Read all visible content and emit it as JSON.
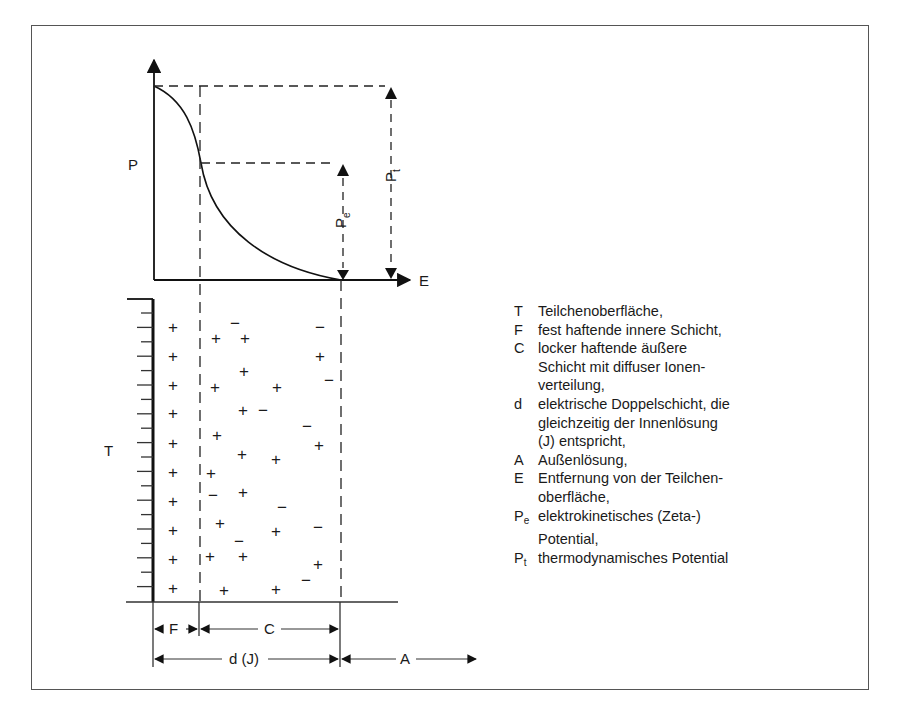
{
  "diagram": {
    "axis": {
      "y_label": "P",
      "x_label": "E"
    },
    "potential_labels": {
      "pe": "P",
      "pe_sub": "e",
      "pt": "P",
      "pt_sub": "t"
    },
    "wall_label": "T",
    "dimensions": {
      "F": "F",
      "C": "C",
      "d": "d (J)",
      "A": "A"
    },
    "charges": {
      "fixed_layer_plus_y": [
        327,
        356,
        385,
        413,
        443,
        472,
        501,
        530,
        559,
        588
      ],
      "diffuse": [
        {
          "s": "−",
          "x": 235,
          "y": 323
        },
        {
          "s": "−",
          "x": 320,
          "y": 327
        },
        {
          "s": "+",
          "x": 216,
          "y": 338
        },
        {
          "s": "+",
          "x": 245,
          "y": 338
        },
        {
          "s": "+",
          "x": 320,
          "y": 356
        },
        {
          "s": "+",
          "x": 244,
          "y": 371
        },
        {
          "s": "−",
          "x": 329,
          "y": 380
        },
        {
          "s": "+",
          "x": 215,
          "y": 387
        },
        {
          "s": "+",
          "x": 277,
          "y": 387
        },
        {
          "s": "+",
          "x": 243,
          "y": 410
        },
        {
          "s": "−",
          "x": 263,
          "y": 410
        },
        {
          "s": "−",
          "x": 307,
          "y": 426
        },
        {
          "s": "+",
          "x": 217,
          "y": 435
        },
        {
          "s": "+",
          "x": 319,
          "y": 445
        },
        {
          "s": "+",
          "x": 242,
          "y": 454
        },
        {
          "s": "+",
          "x": 276,
          "y": 459
        },
        {
          "s": "+",
          "x": 211,
          "y": 473
        },
        {
          "s": "−",
          "x": 213,
          "y": 495
        },
        {
          "s": "+",
          "x": 243,
          "y": 492
        },
        {
          "s": "−",
          "x": 282,
          "y": 507
        },
        {
          "s": "+",
          "x": 220,
          "y": 523
        },
        {
          "s": "+",
          "x": 276,
          "y": 531
        },
        {
          "s": "−",
          "x": 318,
          "y": 527
        },
        {
          "s": "−",
          "x": 239,
          "y": 541
        },
        {
          "s": "+",
          "x": 210,
          "y": 556
        },
        {
          "s": "+",
          "x": 243,
          "y": 556
        },
        {
          "s": "+",
          "x": 318,
          "y": 564
        },
        {
          "s": "−",
          "x": 306,
          "y": 580
        },
        {
          "s": "+",
          "x": 224,
          "y": 590
        },
        {
          "s": "+",
          "x": 276,
          "y": 589
        }
      ]
    }
  },
  "legend": [
    {
      "key": "T",
      "text": "Teilchenoberfläche,"
    },
    {
      "key": "F",
      "text": "fest haftende innere Schicht,"
    },
    {
      "key": "C",
      "text": "locker haftende äußere"
    },
    {
      "key": "",
      "text": "Schicht mit diffuser Ionen-"
    },
    {
      "key": "",
      "text": "verteilung,"
    },
    {
      "key": "d",
      "text": "elektrische Doppelschicht, die"
    },
    {
      "key": "",
      "text": "gleichzeitig der Innenlösung"
    },
    {
      "key": "",
      "text": "(J) entspricht,"
    },
    {
      "key": "A",
      "text": "Außenlösung,"
    },
    {
      "key": "E",
      "text": "Entfernung von der Teilchen-"
    },
    {
      "key": "",
      "text": "oberfläche,"
    },
    {
      "key": "P",
      "sub": "e",
      "text": "elektrokinetisches (Zeta-)"
    },
    {
      "key": "",
      "text": "Potential,"
    },
    {
      "key": "P",
      "sub": "t",
      "text": "thermodynamisches Potential"
    }
  ]
}
